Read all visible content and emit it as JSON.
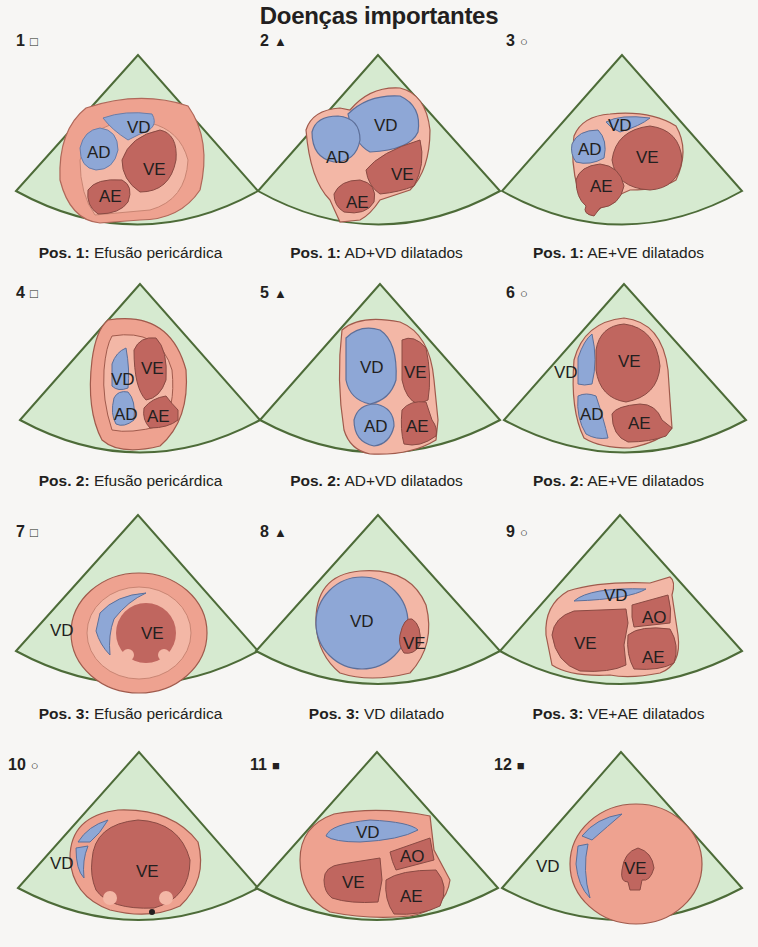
{
  "title": "Doenças importantes",
  "colors": {
    "sector_fill": "#d6ead0",
    "sector_stroke": "#4d6b38",
    "pericardium": "#eea290",
    "wall": "#f3b7a6",
    "left_chamber": "#c0665f",
    "right_chamber": "#8ea7d6",
    "chamber_stroke": "#8a4a43"
  },
  "legend_markers": {
    "open-square": "□",
    "filled-triangle": "▲",
    "open-circle": "○",
    "filled-square": "■"
  },
  "panels": [
    {
      "number": "1",
      "marker": "□",
      "marker_name": "open-square",
      "caption_pos": "Pos. 1:",
      "caption_text": "Efusão pericárdica",
      "labels": {
        "VD": "VD",
        "AD": "AD",
        "VE": "VE",
        "AE": "AE"
      }
    },
    {
      "number": "2",
      "marker": "▲",
      "marker_name": "filled-triangle",
      "caption_pos": "Pos. 1:",
      "caption_text": "AD+VD dilatados",
      "labels": {
        "VD": "VD",
        "AD": "AD",
        "VE": "VE",
        "AE": "AE"
      }
    },
    {
      "number": "3",
      "marker": "○",
      "marker_name": "open-circle",
      "caption_pos": "Pos. 1:",
      "caption_text": "AE+VE dilatados",
      "labels": {
        "VD": "VD",
        "AD": "AD",
        "VE": "VE",
        "AE": "AE"
      }
    },
    {
      "number": "4",
      "marker": "□",
      "marker_name": "open-square",
      "caption_pos": "Pos. 2:",
      "caption_text": "Efusão pericárdica",
      "labels": {
        "VD": "VD",
        "AD": "AD",
        "VE": "VE",
        "AE": "AE"
      }
    },
    {
      "number": "5",
      "marker": "▲",
      "marker_name": "filled-triangle",
      "caption_pos": "Pos. 2:",
      "caption_text": "AD+VD dilatados",
      "labels": {
        "VD": "VD",
        "AD": "AD",
        "VE": "VE",
        "AE": "AE"
      }
    },
    {
      "number": "6",
      "marker": "○",
      "marker_name": "open-circle",
      "caption_pos": "Pos. 2:",
      "caption_text": "AE+VE dilatados",
      "labels": {
        "VD": "VD",
        "AD": "AD",
        "VE": "VE",
        "AE": "AE"
      }
    },
    {
      "number": "7",
      "marker": "□",
      "marker_name": "open-square",
      "caption_pos": "Pos. 3:",
      "caption_text": "Efusão pericárdica",
      "labels": {
        "VD": "VD",
        "VE": "VE"
      }
    },
    {
      "number": "8",
      "marker": "▲",
      "marker_name": "filled-triangle",
      "caption_pos": "Pos. 3:",
      "caption_text": "VD dilatado",
      "labels": {
        "VD": "VD",
        "VE": "VE"
      }
    },
    {
      "number": "9",
      "marker": "○",
      "marker_name": "open-circle",
      "caption_pos": "Pos. 3:",
      "caption_text": "VE+AE dilatados",
      "labels": {
        "VD": "VD",
        "AO": "AO",
        "VE": "VE",
        "AE": "AE"
      }
    },
    {
      "number": "10",
      "marker": "○",
      "marker_name": "open-circle",
      "caption_pos": "",
      "caption_text": "",
      "labels": {
        "VD": "VD",
        "VE": "VE"
      }
    },
    {
      "number": "11",
      "marker": "■",
      "marker_name": "filled-square",
      "caption_pos": "",
      "caption_text": "",
      "labels": {
        "VD": "VD",
        "AO": "AO",
        "VE": "VE",
        "AE": "AE"
      }
    },
    {
      "number": "12",
      "marker": "■",
      "marker_name": "filled-square",
      "caption_pos": "",
      "caption_text": "",
      "labels": {
        "VD": "VD",
        "VE": "VE"
      }
    }
  ]
}
